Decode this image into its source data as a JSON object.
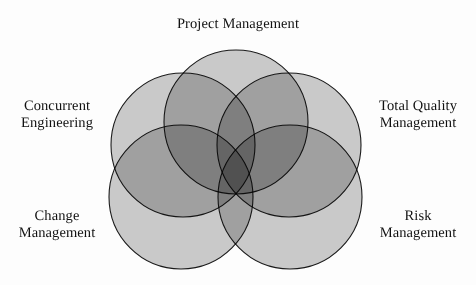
{
  "diagram": {
    "type": "venn",
    "background_color": "#fdfdfd",
    "fill_color": "#ababab",
    "overlap_color": "#303030",
    "outline_color": "#1a1a1a",
    "text_color": "#111111",
    "set_count": 5,
    "sets": [
      {
        "id": "project-management",
        "label": "Project Management",
        "label_position": "top",
        "cx": 236,
        "cy": 122,
        "r": 72
      },
      {
        "id": "concurrent-engineering",
        "label": "Concurrent\nEngineering",
        "label_position": "left-upper",
        "cx": 183,
        "cy": 145,
        "r": 72
      },
      {
        "id": "total-quality-management",
        "label": "Total Quality\nManagement",
        "label_position": "right-upper",
        "cx": 289,
        "cy": 145,
        "r": 72
      },
      {
        "id": "change-management",
        "label": "Change\nManagement",
        "label_position": "left-lower",
        "cx": 181,
        "cy": 197,
        "r": 72
      },
      {
        "id": "risk-management",
        "label": "Risk\nManagement",
        "label_position": "right-lower",
        "cx": 290,
        "cy": 197,
        "r": 72
      }
    ]
  }
}
